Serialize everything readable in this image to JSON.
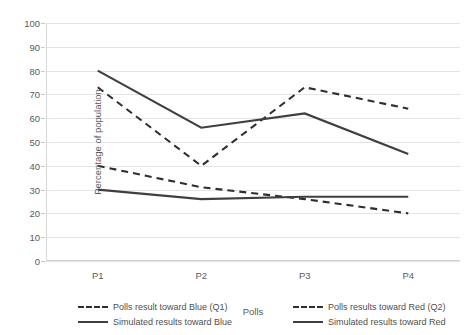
{
  "chart_data": {
    "type": "line",
    "title": "",
    "xlabel": "Polls",
    "ylabel": "Percentage of population",
    "categories": [
      "P1",
      "P2",
      "P3",
      "P4"
    ],
    "ylim": [
      0,
      100
    ],
    "yticks": [
      0,
      10,
      20,
      30,
      40,
      50,
      60,
      70,
      80,
      90,
      100
    ],
    "grid": true,
    "legend_position": "bottom",
    "series": [
      {
        "name": "Polls result toward Blue (Q1)",
        "style": "dashed",
        "color": "#2e2e2e",
        "values": [
          40,
          31,
          26,
          20
        ]
      },
      {
        "name": "Polls results toward Red (Q2)",
        "style": "dashed",
        "color": "#2e2e2e",
        "values": [
          73,
          40,
          73,
          64
        ]
      },
      {
        "name": "Simulated results toward Blue",
        "style": "solid",
        "color": "#3f3f3f",
        "values": [
          30,
          26,
          27,
          27
        ]
      },
      {
        "name": "Simulated results toward Red",
        "style": "solid",
        "color": "#3f3f3f",
        "values": [
          80,
          56,
          62,
          45
        ]
      }
    ]
  }
}
